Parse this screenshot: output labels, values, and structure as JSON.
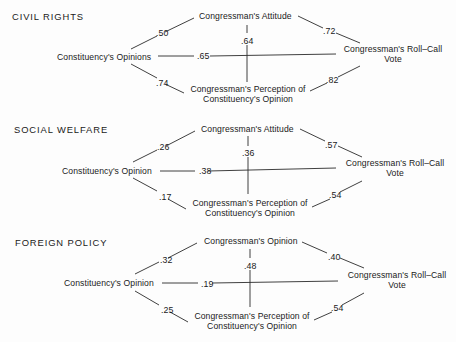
{
  "panels": [
    {
      "title": "CIVIL RIGHTS",
      "nodes": {
        "constituency": "Constituency's Opinions",
        "attitude": "Congressman's Attitude",
        "vote_line1": "Congressman's Roll–Call",
        "vote_line2": "Vote",
        "perception_line1": "Congressman's Perception of",
        "perception_line2": "Constituency's Opinion"
      },
      "coefficients": {
        "constituency_attitude": ".50",
        "constituency_vote": ".65",
        "attitude_perception": ".64",
        "constituency_perception": ".74",
        "attitude_vote": ".72",
        "perception_vote": ".82"
      }
    },
    {
      "title": "SOCIAL WELFARE",
      "nodes": {
        "constituency": "Constituency's Opinion",
        "attitude": "Congressman's Attitude",
        "vote_line1": "Congressman's Roll–Call",
        "vote_line2": "Vote",
        "perception_line1": "Congressman's Perception of",
        "perception_line2": "Constituency's Opinion"
      },
      "coefficients": {
        "constituency_attitude": ".26",
        "constituency_vote": ".38",
        "attitude_perception": ".36",
        "constituency_perception": ".17",
        "attitude_vote": ".57",
        "perception_vote": ".54"
      }
    },
    {
      "title": "FOREIGN POLICY",
      "nodes": {
        "constituency": "Constituency's Opinion",
        "attitude": "Congressman's Opinion",
        "vote_line1": "Congressman's Roll–Call",
        "vote_line2": "Vote",
        "perception_line1": "Congressman's Perception of",
        "perception_line2": "Constituency's Opinion"
      },
      "coefficients": {
        "constituency_attitude": ".32",
        "constituency_vote": ".19",
        "attitude_perception": ".48",
        "constituency_perception": ".25",
        "attitude_vote": ".40",
        "perception_vote": ".54"
      }
    }
  ]
}
